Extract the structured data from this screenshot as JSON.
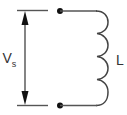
{
  "diagram": {
    "type": "circuit-schematic",
    "title": "",
    "source_label": "V",
    "source_subscript": "s",
    "inductor_label": "L",
    "components": [
      {
        "kind": "voltage-arrow",
        "label": "Vs",
        "direction": "bidirectional-vertical"
      },
      {
        "kind": "terminal",
        "position": "top"
      },
      {
        "kind": "terminal",
        "position": "bottom"
      },
      {
        "kind": "inductor",
        "label": "L",
        "turns": 4
      }
    ],
    "colors": {
      "wire": "#555555",
      "coil": "#444444",
      "terminal": "#111111",
      "text": "#333333"
    }
  }
}
